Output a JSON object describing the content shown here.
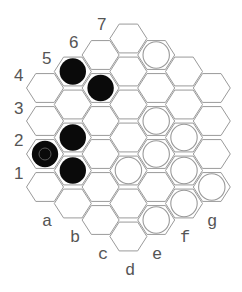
{
  "game": {
    "board_type": "hex-hex",
    "colors": {
      "black": "#0a0a0a",
      "white": "#ffffff",
      "grid": "#9a9a9a",
      "label": "#555555"
    },
    "row_labels": [
      "1",
      "2",
      "3",
      "4",
      "5",
      "6",
      "7"
    ],
    "column_labels": [
      "a",
      "b",
      "c",
      "d",
      "e",
      "f",
      "g"
    ],
    "columns": [
      {
        "label": "a",
        "first_row": 1,
        "cells": [
          "empty",
          "black",
          "empty",
          "empty"
        ]
      },
      {
        "label": "b",
        "first_row": 1,
        "cells": [
          "empty",
          "black",
          "black",
          "empty",
          "black"
        ]
      },
      {
        "label": "c",
        "first_row": 1,
        "cells": [
          "empty",
          "empty",
          "empty",
          "empty",
          "black",
          "empty"
        ]
      },
      {
        "label": "d",
        "first_row": 1,
        "cells": [
          "empty",
          "empty",
          "white",
          "empty",
          "empty",
          "empty",
          "empty"
        ]
      },
      {
        "label": "e",
        "first_row": 2,
        "cells": [
          "white",
          "empty",
          "white",
          "white",
          "empty",
          "white"
        ]
      },
      {
        "label": "f",
        "first_row": 3,
        "cells": [
          "white",
          "white",
          "white",
          "empty",
          "empty"
        ]
      },
      {
        "label": "g",
        "first_row": 4,
        "cells": [
          "white",
          "empty",
          "empty",
          "empty"
        ]
      }
    ],
    "last_move": "a2"
  }
}
